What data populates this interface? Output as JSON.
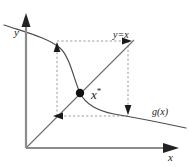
{
  "figure": {
    "width": 189,
    "height": 167,
    "background": "#ffffff"
  },
  "axes": {
    "color": "#8c8c8c",
    "origin": {
      "x": 26,
      "y": 148
    },
    "y_axis": {
      "label": "y",
      "from": {
        "x": 26,
        "y": 148
      },
      "to": {
        "x": 26,
        "y": 18
      }
    },
    "x_axis": {
      "label": "x",
      "from": {
        "x": 26,
        "y": 148
      },
      "to": {
        "x": 178,
        "y": 148
      }
    }
  },
  "curves": {
    "identity_line": {
      "label": "y=x",
      "color": "#6e6e6e",
      "from": {
        "x": 26,
        "y": 148
      },
      "to": {
        "x": 133,
        "y": 41
      }
    },
    "g_curve": {
      "label": "g(x)",
      "color": "#4d4d4d",
      "description": "decreasing sigmoid-shaped curve from upper-left to lower-right"
    }
  },
  "fixed_point": {
    "label": "x",
    "superscript": "*",
    "color": "#111111",
    "x": 80,
    "y": 93,
    "radius": 4
  },
  "cobweb": {
    "color": "#9a9a9a",
    "style": "dashed",
    "arrow_color": "#1a1a1a",
    "arrows": [
      {
        "name": "arrow-up-left",
        "direction": "up",
        "x": 57,
        "y": 48
      },
      {
        "name": "arrow-right-top",
        "direction": "right",
        "x": 128,
        "y": 41
      },
      {
        "name": "arrow-down-right",
        "direction": "down",
        "x": 122,
        "y": 111
      },
      {
        "name": "arrow-left-bottom",
        "direction": "left",
        "x": 56,
        "y": 116
      }
    ],
    "box": {
      "left": 57,
      "top": 41,
      "right": 128,
      "bottom": 116
    }
  }
}
